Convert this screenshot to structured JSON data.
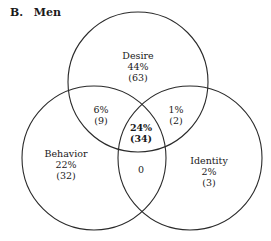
{
  "figure": {
    "label": "B.",
    "title": "Men"
  },
  "sets": [
    {
      "name": "Desire",
      "cx": 138,
      "cy": 82,
      "r": 70
    },
    {
      "name": "Behavior",
      "cx": 94,
      "cy": 158,
      "r": 72
    },
    {
      "name": "Identity",
      "cx": 190,
      "cy": 158,
      "r": 72
    }
  ],
  "regions": {
    "desire_only": {
      "name": "Desire",
      "percent": "44%",
      "count": "(63)"
    },
    "behavior_only": {
      "name": "Behavior",
      "percent": "22%",
      "count": "(32)"
    },
    "identity_only": {
      "name": "Identity",
      "percent": "2%",
      "count": "(3)"
    },
    "desire_behavior": {
      "percent": "6%",
      "count": "(9)"
    },
    "desire_identity": {
      "percent": "1%",
      "count": "(2)"
    },
    "all_three": {
      "percent": "24%",
      "count": "(34)"
    },
    "behavior_identity": {
      "value": "0"
    }
  },
  "colors": {
    "stroke": "#2a2a2a",
    "text": "#1a1a1a"
  }
}
